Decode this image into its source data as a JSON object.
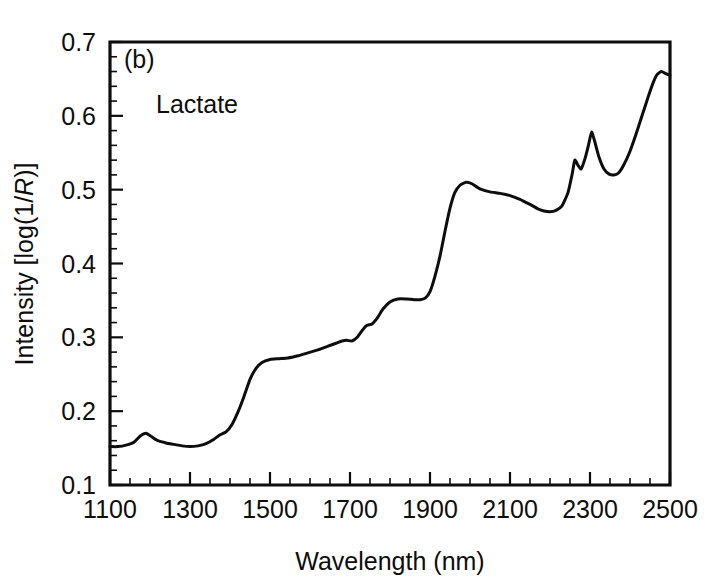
{
  "figure": {
    "panel_label": "(b)",
    "background_color": "#ffffff",
    "line_color": "#0d0d0d"
  },
  "chart_data": {
    "type": "line",
    "title": "",
    "panel_label": "(b)",
    "annotation": "Lactate",
    "xlabel": "Wavelength (nm)",
    "ylabel_plain": "Intensity [log(1/R)]",
    "ylabel_parts": {
      "prefix": "Intensity [log(1/",
      "italic": "R",
      "suffix": ")]"
    },
    "xlim": [
      1100,
      2500
    ],
    "ylim": [
      0.1,
      0.7
    ],
    "xticks": [
      1100,
      1300,
      1500,
      1700,
      1900,
      2100,
      2300,
      2500
    ],
    "xticklabels": [
      "1100",
      "1300",
      "1500",
      "1700",
      "1900",
      "2100",
      "2300",
      "2500"
    ],
    "yticks": [
      0.1,
      0.2,
      0.3,
      0.4,
      0.5,
      0.6,
      0.7
    ],
    "yticklabels": [
      "0.1",
      "0.2",
      "0.3",
      "0.4",
      "0.5",
      "0.6",
      "0.7"
    ],
    "x_minor_step": 50,
    "y_minor_step": 0.02,
    "grid": false,
    "legend": "none",
    "series": [
      {
        "name": "Lactate",
        "x": [
          1100,
          1120,
          1140,
          1160,
          1175,
          1190,
          1205,
          1220,
          1240,
          1260,
          1280,
          1300,
          1320,
          1340,
          1360,
          1375,
          1390,
          1405,
          1420,
          1435,
          1450,
          1465,
          1480,
          1500,
          1520,
          1545,
          1570,
          1595,
          1620,
          1645,
          1665,
          1680,
          1692,
          1705,
          1718,
          1730,
          1742,
          1755,
          1768,
          1782,
          1800,
          1820,
          1840,
          1860,
          1875,
          1888,
          1900,
          1912,
          1925,
          1938,
          1950,
          1962,
          1975,
          1990,
          2005,
          2025,
          2050,
          2075,
          2100,
          2125,
          2150,
          2170,
          2185,
          2200,
          2215,
          2230,
          2245,
          2255,
          2262,
          2270,
          2278,
          2288,
          2296,
          2304,
          2312,
          2322,
          2335,
          2348,
          2360,
          2372,
          2385,
          2400,
          2415,
          2430,
          2445,
          2458,
          2468,
          2478,
          2490,
          2500
        ],
        "y": [
          0.152,
          0.152,
          0.154,
          0.158,
          0.166,
          0.17,
          0.165,
          0.16,
          0.157,
          0.155,
          0.153,
          0.152,
          0.153,
          0.156,
          0.162,
          0.168,
          0.172,
          0.182,
          0.199,
          0.22,
          0.243,
          0.258,
          0.266,
          0.27,
          0.271,
          0.272,
          0.275,
          0.279,
          0.283,
          0.288,
          0.292,
          0.295,
          0.296,
          0.295,
          0.3,
          0.309,
          0.316,
          0.318,
          0.326,
          0.338,
          0.348,
          0.352,
          0.352,
          0.351,
          0.351,
          0.353,
          0.362,
          0.382,
          0.41,
          0.445,
          0.475,
          0.496,
          0.506,
          0.51,
          0.508,
          0.501,
          0.497,
          0.495,
          0.492,
          0.487,
          0.48,
          0.474,
          0.471,
          0.47,
          0.472,
          0.478,
          0.496,
          0.52,
          0.54,
          0.533,
          0.528,
          0.543,
          0.56,
          0.578,
          0.565,
          0.545,
          0.528,
          0.521,
          0.52,
          0.523,
          0.534,
          0.552,
          0.575,
          0.6,
          0.625,
          0.645,
          0.656,
          0.66,
          0.657,
          0.655
        ]
      }
    ]
  }
}
